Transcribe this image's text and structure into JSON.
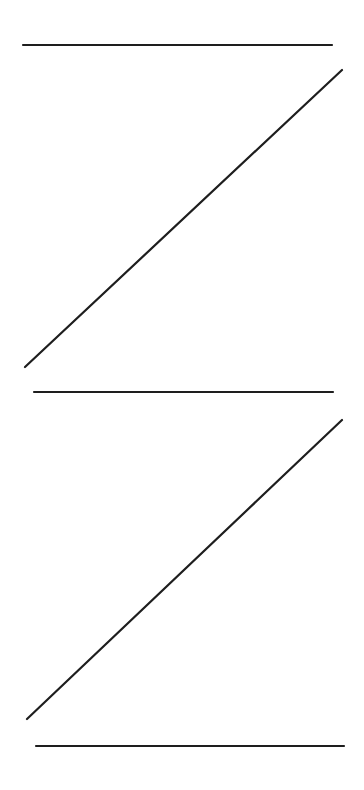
{
  "canvas": {
    "width": 364,
    "height": 790,
    "background": "#ffffff",
    "stroke_color": "#1e1e1e",
    "stroke_width": 2.2
  },
  "shapes": [
    {
      "name": "z-shape-top",
      "lines": [
        {
          "name": "top-horizontal",
          "x1": 23,
          "y1": 45,
          "x2": 332,
          "y2": 45
        },
        {
          "name": "top-diagonal",
          "x1": 342,
          "y1": 70,
          "x2": 25,
          "y2": 367
        },
        {
          "name": "middle-horizontal",
          "x1": 34,
          "y1": 392,
          "x2": 333,
          "y2": 392
        }
      ]
    },
    {
      "name": "z-shape-bottom",
      "lines": [
        {
          "name": "bottom-diagonal",
          "x1": 342,
          "y1": 420,
          "x2": 27,
          "y2": 719
        },
        {
          "name": "bottom-horizontal",
          "x1": 36,
          "y1": 746,
          "x2": 344,
          "y2": 746
        }
      ]
    }
  ]
}
